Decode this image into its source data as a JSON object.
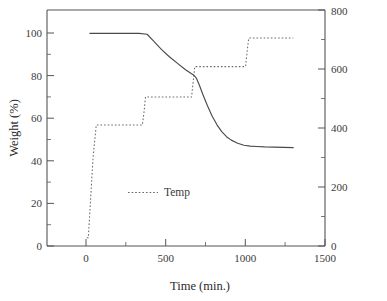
{
  "chart_data": {
    "type": "line",
    "title": "",
    "xlabel": "Time (min.)",
    "ylabel": "Weight (%)",
    "y2label": "",
    "xlim": [
      -250,
      1500
    ],
    "ylim": [
      0,
      111
    ],
    "y2lim": [
      0,
      800
    ],
    "grid": false,
    "legend_position": "center-left-inside",
    "xticks": [
      0,
      500,
      1000,
      1500
    ],
    "xticklabels": [
      "0",
      "500",
      "1000",
      "1500"
    ],
    "xminorticks": [
      250,
      750,
      1250
    ],
    "yticks": [
      0,
      20,
      40,
      60,
      80,
      100
    ],
    "yticklabels": [
      "0",
      "20",
      "40",
      "60",
      "80",
      "100"
    ],
    "yminorticks": [
      10,
      30,
      50,
      70,
      90
    ],
    "y2ticks": [
      0,
      200,
      400,
      600,
      800
    ],
    "y2ticklabels": [
      "0",
      "200",
      "400",
      "600",
      "800"
    ],
    "y2minorticks": [
      100,
      300,
      500,
      700
    ],
    "series": [
      {
        "name": "Weight",
        "axis": "left",
        "style": "solid",
        "unit": "%",
        "x": [
          20,
          120,
          250,
          330,
          380,
          420,
          470,
          520,
          570,
          620,
          660,
          675,
          690,
          710,
          730,
          760,
          790,
          820,
          850,
          880,
          910,
          950,
          990,
          1030,
          1070,
          1120,
          1180,
          1240,
          1300
        ],
        "y": [
          100,
          100,
          100,
          100,
          99.6,
          96.5,
          92.5,
          89.0,
          86.0,
          83.0,
          81.0,
          80.3,
          79.0,
          75.5,
          71.5,
          66.0,
          61.0,
          57.0,
          53.8,
          51.4,
          49.8,
          48.3,
          47.4,
          47.0,
          46.8,
          46.6,
          46.5,
          46.4,
          46.3
        ]
      },
      {
        "name": "Temp",
        "axis": "right",
        "style": "dotted",
        "unit": "°C",
        "x": [
          0,
          10,
          40,
          60,
          350,
          360,
          370,
          660,
          670,
          680,
          1000,
          1010,
          1020,
          1300
        ],
        "y": [
          28,
          28,
          300,
          410,
          410,
          450,
          505,
          505,
          555,
          608,
          608,
          660,
          705,
          705
        ]
      }
    ],
    "legend": [
      {
        "label": "Temp",
        "style": "dotted"
      }
    ]
  },
  "colors": {
    "axis": "#555555",
    "weight_line": "#4a4a4a",
    "temp_line": "#6a6a6a",
    "text": "#3a3a3a",
    "background": "#ffffff"
  }
}
